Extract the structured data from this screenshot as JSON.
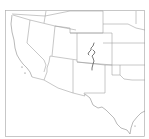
{
  "map": {
    "region": "Southwestern United States",
    "frame_color": "#b0b0b0",
    "border_color": "#9a9a9a",
    "feature_color": "#555555",
    "states_visible": [
      "California",
      "Nevada",
      "Utah",
      "Arizona",
      "Colorado",
      "New Mexico",
      "Texas",
      "Wyoming",
      "Nebraska",
      "Kansas",
      "Oklahoma",
      "Oregon",
      "Idaho"
    ],
    "highlighted_feature": "Linear feature in central Colorado running north–south"
  }
}
